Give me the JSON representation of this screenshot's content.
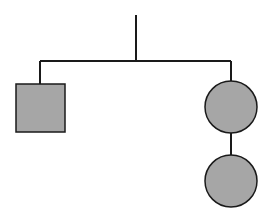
{
  "diagram": {
    "type": "pedigree",
    "colors": {
      "background": "#ffffff",
      "line": "#1a1a1a",
      "fill": "#a6a6a6"
    },
    "nodes": [
      {
        "id": "male-child",
        "shape": "square",
        "x": 16,
        "y": 84,
        "w": 49,
        "h": 48
      },
      {
        "id": "female-child",
        "shape": "circle",
        "cx": 231,
        "cy": 107,
        "r": 26
      },
      {
        "id": "female-descendant",
        "shape": "circle",
        "cx": 231,
        "cy": 181,
        "r": 26
      }
    ],
    "lines": [
      {
        "id": "parent-descent-line",
        "x1": 136,
        "y1": 15,
        "x2": 136,
        "y2": 61
      },
      {
        "id": "sibship-line",
        "x1": 40,
        "y1": 61,
        "x2": 231,
        "y2": 61
      },
      {
        "id": "left-child-line",
        "x1": 40,
        "y1": 61,
        "x2": 40,
        "y2": 84
      },
      {
        "id": "right-child-line",
        "x1": 231,
        "y1": 61,
        "x2": 231,
        "y2": 81
      },
      {
        "id": "descendant-line",
        "x1": 231,
        "y1": 133,
        "x2": 231,
        "y2": 155
      }
    ]
  }
}
